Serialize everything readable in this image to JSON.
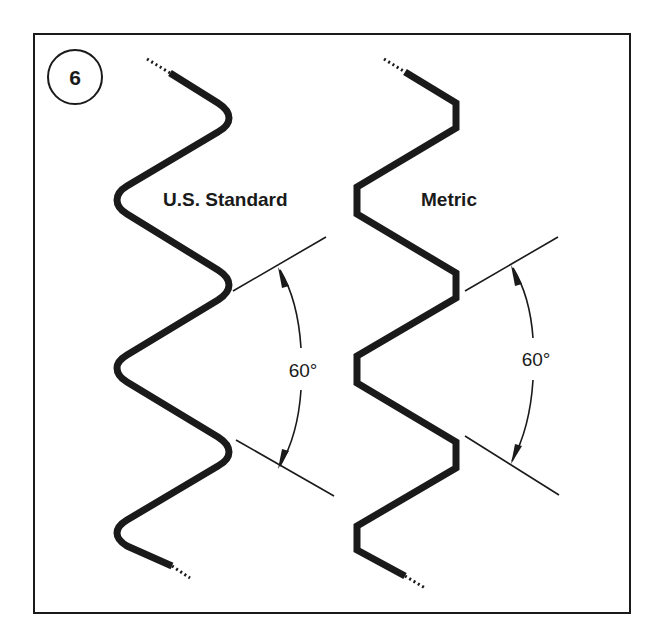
{
  "figure": {
    "number": "6",
    "colors": {
      "ink": "#1a1a1a",
      "background": "#ffffff"
    }
  },
  "panels": [
    {
      "id": "us-standard",
      "title": "U.S. Standard",
      "angle_label": "60°",
      "thread_form": "rounded crests and roots"
    },
    {
      "id": "metric",
      "title": "Metric",
      "angle_label": "60°",
      "thread_form": "flat crests and roots"
    }
  ]
}
